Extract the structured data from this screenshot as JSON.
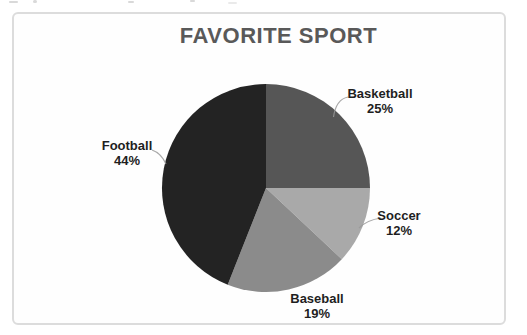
{
  "chart_data": {
    "type": "pie",
    "title": "FAVORITE SPORT",
    "categories": [
      "Basketball",
      "Soccer",
      "Baseball",
      "Football"
    ],
    "values": [
      25,
      12,
      19,
      44
    ],
    "unit": "percent",
    "start_angle_deg": 0,
    "direction": "clockwise",
    "legend": "none",
    "data_labels": "category name and percentage placed outside slices, leader lines on Basketball, Soccer and Football"
  },
  "title": {
    "text": "FAVORITE SPORT",
    "color": "#595959"
  },
  "slices": [
    {
      "name": "Basketball",
      "pct": "25%",
      "value": 25,
      "color": "#565656"
    },
    {
      "name": "Soccer",
      "pct": "12%",
      "value": 12,
      "color": "#a9a9a9"
    },
    {
      "name": "Baseball",
      "pct": "19%",
      "value": 19,
      "color": "#8b8b8b"
    },
    {
      "name": "Football",
      "pct": "44%",
      "value": 44,
      "color": "#232323"
    }
  ],
  "colors": {
    "label_text": "#1f1f1f",
    "frame_border": "#dcdcdc",
    "leader_line": "#9a9a9a",
    "background": "#ffffff"
  }
}
